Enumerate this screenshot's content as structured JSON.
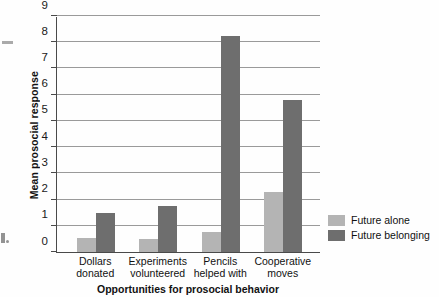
{
  "chart_data": {
    "type": "bar",
    "title": "",
    "categories": [
      "Dollars donated",
      "Experiments volunteered",
      "Pencils helped with",
      "Cooperative moves"
    ],
    "category_lines": [
      [
        "Dollars",
        "donated"
      ],
      [
        "Experiments",
        "volunteered"
      ],
      [
        "Pencils",
        "helped with"
      ],
      [
        "Cooperative",
        "moves"
      ]
    ],
    "series": [
      {
        "name": "Future alone",
        "color": "#b4b4b4",
        "values": [
          0.55,
          0.5,
          0.75,
          2.3
        ]
      },
      {
        "name": "Future belonging",
        "color": "#6e6e6e",
        "values": [
          1.5,
          1.75,
          8.25,
          5.8
        ]
      }
    ],
    "xlabel": "Opportunities for prosocial behavior",
    "ylabel": "Mean prosocial response",
    "ylim": [
      0,
      9
    ],
    "yticks": [
      0,
      1,
      2,
      3,
      4,
      5,
      6,
      7,
      8,
      9
    ],
    "ytick_labels": [
      "0",
      "1",
      "2",
      "3",
      "4",
      "5",
      "6",
      "7",
      "8",
      "9"
    ],
    "grid": "horizontal",
    "legend_position": "right"
  },
  "legend": {
    "items": [
      {
        "label": "Future alone"
      },
      {
        "label": "Future belonging"
      }
    ]
  }
}
